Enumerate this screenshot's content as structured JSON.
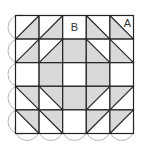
{
  "diagram": {
    "grid": {
      "rows": 5,
      "cols": 5,
      "left": 15.5,
      "top": 15.5,
      "cell": 23.6
    },
    "colors": {
      "shade": "#d9d9d9",
      "line": "#222222",
      "arc": "#b5b5b5",
      "background": "#ffffff"
    },
    "labels": [
      {
        "text": "B",
        "row": 0,
        "col": 2,
        "pos": "center"
      },
      {
        "text": "A",
        "row": 0,
        "col": 4,
        "pos": "top-right"
      }
    ],
    "cells": [
      [
        "diag-up:br",
        "diag-up:br",
        "plain",
        "diag-down:bl",
        "diag-down:bl"
      ],
      [
        "diag-up:br",
        "diag-up:br",
        "full",
        "diag-down:bl",
        "diag-down:bl"
      ],
      [
        "plain",
        "full",
        "plain",
        "full",
        "plain"
      ],
      [
        "diag-down:tr",
        "diag-down:tr",
        "full",
        "diag-up:tl",
        "diag-up:tl"
      ],
      [
        "diag-down:tr",
        "diag-down:tr",
        "plain",
        "diag-up:tl",
        "diag-up:tl"
      ]
    ]
  }
}
